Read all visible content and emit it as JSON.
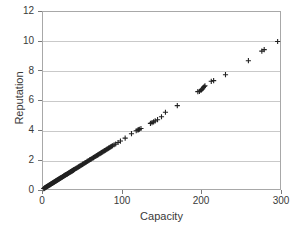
{
  "chart_data": {
    "type": "scatter",
    "title": "",
    "xlabel": "Capacity",
    "ylabel": "Reputation",
    "xlim": [
      0,
      300
    ],
    "ylim": [
      0,
      12
    ],
    "xticks": [
      0,
      100,
      200,
      300
    ],
    "yticks": [
      0,
      2,
      4,
      6,
      8,
      10,
      12
    ],
    "grid": {
      "horizontal": true,
      "vertical": false
    },
    "legend": null,
    "marker": "plus",
    "marker_color": "#222222",
    "series": [
      {
        "name": "Capacity vs Reputation",
        "points": [
          [
            1,
            0.03
          ],
          [
            1.5,
            0.05
          ],
          [
            2,
            0.07
          ],
          [
            2.5,
            0.08
          ],
          [
            3,
            0.1
          ],
          [
            3.5,
            0.12
          ],
          [
            4,
            0.13
          ],
          [
            4.5,
            0.15
          ],
          [
            5,
            0.17
          ],
          [
            5.5,
            0.18
          ],
          [
            6,
            0.2
          ],
          [
            6.5,
            0.22
          ],
          [
            7,
            0.23
          ],
          [
            7.5,
            0.25
          ],
          [
            8,
            0.27
          ],
          [
            8.5,
            0.28
          ],
          [
            9,
            0.3
          ],
          [
            9.5,
            0.32
          ],
          [
            10,
            0.33
          ],
          [
            10.5,
            0.35
          ],
          [
            11,
            0.37
          ],
          [
            11.5,
            0.38
          ],
          [
            12,
            0.4
          ],
          [
            12.5,
            0.42
          ],
          [
            13,
            0.43
          ],
          [
            13.5,
            0.45
          ],
          [
            14,
            0.47
          ],
          [
            14.5,
            0.48
          ],
          [
            15,
            0.5
          ],
          [
            15.5,
            0.52
          ],
          [
            16,
            0.53
          ],
          [
            16.5,
            0.55
          ],
          [
            17,
            0.57
          ],
          [
            17.5,
            0.58
          ],
          [
            18,
            0.6
          ],
          [
            18.5,
            0.62
          ],
          [
            19,
            0.63
          ],
          [
            19.5,
            0.65
          ],
          [
            20,
            0.67
          ],
          [
            20.5,
            0.68
          ],
          [
            21,
            0.7
          ],
          [
            21.5,
            0.72
          ],
          [
            22,
            0.73
          ],
          [
            22.5,
            0.75
          ],
          [
            23,
            0.77
          ],
          [
            23.5,
            0.78
          ],
          [
            24,
            0.8
          ],
          [
            24.5,
            0.82
          ],
          [
            25,
            0.83
          ],
          [
            25.5,
            0.85
          ],
          [
            26,
            0.87
          ],
          [
            26.5,
            0.88
          ],
          [
            27,
            0.9
          ],
          [
            27.5,
            0.92
          ],
          [
            28,
            0.93
          ],
          [
            28.5,
            0.95
          ],
          [
            29,
            0.97
          ],
          [
            29.5,
            0.98
          ],
          [
            30,
            1.0
          ],
          [
            30.5,
            1.02
          ],
          [
            31,
            1.03
          ],
          [
            31.5,
            1.05
          ],
          [
            32,
            1.07
          ],
          [
            32.5,
            1.08
          ],
          [
            33,
            1.1
          ],
          [
            33.5,
            1.12
          ],
          [
            34,
            1.13
          ],
          [
            34.5,
            1.15
          ],
          [
            35,
            1.17
          ],
          [
            35.5,
            1.18
          ],
          [
            36,
            1.2
          ],
          [
            36.5,
            1.22
          ],
          [
            37,
            1.23
          ],
          [
            37.5,
            1.25
          ],
          [
            38,
            1.27
          ],
          [
            38.5,
            1.28
          ],
          [
            39,
            1.3
          ],
          [
            39.5,
            1.32
          ],
          [
            40,
            1.33
          ],
          [
            41,
            1.37
          ],
          [
            42,
            1.4
          ],
          [
            43,
            1.43
          ],
          [
            44,
            1.47
          ],
          [
            45,
            1.5
          ],
          [
            46,
            1.53
          ],
          [
            47,
            1.57
          ],
          [
            48,
            1.6
          ],
          [
            49,
            1.63
          ],
          [
            50,
            1.67
          ],
          [
            51,
            1.7
          ],
          [
            52,
            1.73
          ],
          [
            53,
            1.77
          ],
          [
            54,
            1.8
          ],
          [
            55,
            1.83
          ],
          [
            56,
            1.87
          ],
          [
            57,
            1.9
          ],
          [
            58,
            1.93
          ],
          [
            59,
            1.97
          ],
          [
            60,
            2.0
          ],
          [
            61,
            2.03
          ],
          [
            62,
            2.07
          ],
          [
            63,
            2.1
          ],
          [
            64,
            2.13
          ],
          [
            65,
            2.17
          ],
          [
            66,
            2.2
          ],
          [
            67,
            2.23
          ],
          [
            68,
            2.27
          ],
          [
            69,
            2.3
          ],
          [
            70,
            2.33
          ],
          [
            71,
            2.37
          ],
          [
            72,
            2.4
          ],
          [
            73,
            2.43
          ],
          [
            74,
            2.47
          ],
          [
            75,
            2.5
          ],
          [
            76,
            2.53
          ],
          [
            77,
            2.57
          ],
          [
            78,
            2.6
          ],
          [
            79,
            2.63
          ],
          [
            80,
            2.67
          ],
          [
            81,
            2.7
          ],
          [
            82,
            2.73
          ],
          [
            83,
            2.77
          ],
          [
            84,
            2.8
          ],
          [
            85,
            2.83
          ],
          [
            86,
            2.87
          ],
          [
            87,
            2.9
          ],
          [
            88,
            2.93
          ],
          [
            90,
            3.0
          ],
          [
            92,
            3.05
          ],
          [
            95,
            3.15
          ],
          [
            98,
            3.25
          ],
          [
            104,
            3.45
          ],
          [
            112,
            3.75
          ],
          [
            118,
            3.95
          ],
          [
            120,
            4.0
          ],
          [
            121,
            4.02
          ],
          [
            122,
            4.05
          ],
          [
            124,
            4.1
          ],
          [
            136,
            4.45
          ],
          [
            138,
            4.5
          ],
          [
            140,
            4.55
          ],
          [
            142,
            4.62
          ],
          [
            145,
            4.7
          ],
          [
            150,
            4.9
          ],
          [
            155,
            5.2
          ],
          [
            170,
            5.65
          ],
          [
            196,
            6.6
          ],
          [
            198,
            6.62
          ],
          [
            200,
            6.68
          ],
          [
            201,
            6.75
          ],
          [
            202,
            6.8
          ],
          [
            203,
            6.88
          ],
          [
            204,
            6.95
          ],
          [
            205,
            7.0
          ],
          [
            213,
            7.3
          ],
          [
            216,
            7.35
          ],
          [
            231,
            7.75
          ],
          [
            260,
            8.7
          ],
          [
            277,
            9.35
          ],
          [
            280,
            9.45
          ],
          [
            297,
            10.0
          ]
        ]
      }
    ]
  },
  "axis": {
    "y_tick_labels": [
      "12",
      "10",
      "8",
      "6",
      "4",
      "2",
      "0"
    ],
    "x_tick_labels": [
      "0",
      "100",
      "200",
      "300"
    ]
  }
}
